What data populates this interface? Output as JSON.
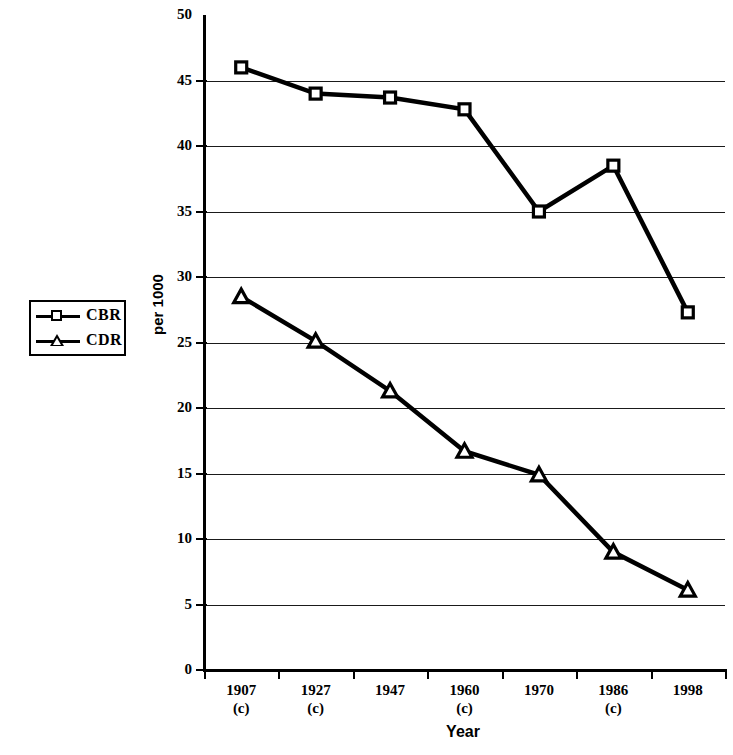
{
  "chart_data": {
    "type": "line",
    "title": "",
    "xlabel": "Year",
    "ylabel": "per 1000",
    "ylim": [
      0,
      50
    ],
    "ytick_values": [
      0,
      5,
      10,
      15,
      20,
      25,
      30,
      35,
      40,
      45,
      50
    ],
    "ytick_labels": [
      "0",
      "5",
      "10",
      "15",
      "20",
      "25",
      "30",
      "35",
      "40",
      "45",
      "50"
    ],
    "grid": "horizontal",
    "legend_position": "left-outside",
    "categories": [
      "1907",
      "1927",
      "1947",
      "1960",
      "1970",
      "1986",
      "1998"
    ],
    "category_notes": [
      "(c)",
      "(c)",
      "",
      "(c)",
      "",
      "(c)",
      ""
    ],
    "series": [
      {
        "name": "CBR",
        "marker": "square",
        "values": [
          46.0,
          44.0,
          43.7,
          42.8,
          35.0,
          38.5,
          27.3
        ]
      },
      {
        "name": "CDR",
        "marker": "triangle",
        "values": [
          28.5,
          25.1,
          21.3,
          16.7,
          14.9,
          9.0,
          6.1
        ]
      }
    ]
  },
  "legend": {
    "items": [
      {
        "label": "CBR",
        "marker": "square-marker-icon"
      },
      {
        "label": "CDR",
        "marker": "triangle-marker-icon"
      }
    ]
  },
  "axes": {
    "x_title": "Year",
    "y_title": "per 1000"
  },
  "colors": {
    "line": "#000000",
    "grid": "#1a1a1a",
    "background": "#ffffff"
  }
}
